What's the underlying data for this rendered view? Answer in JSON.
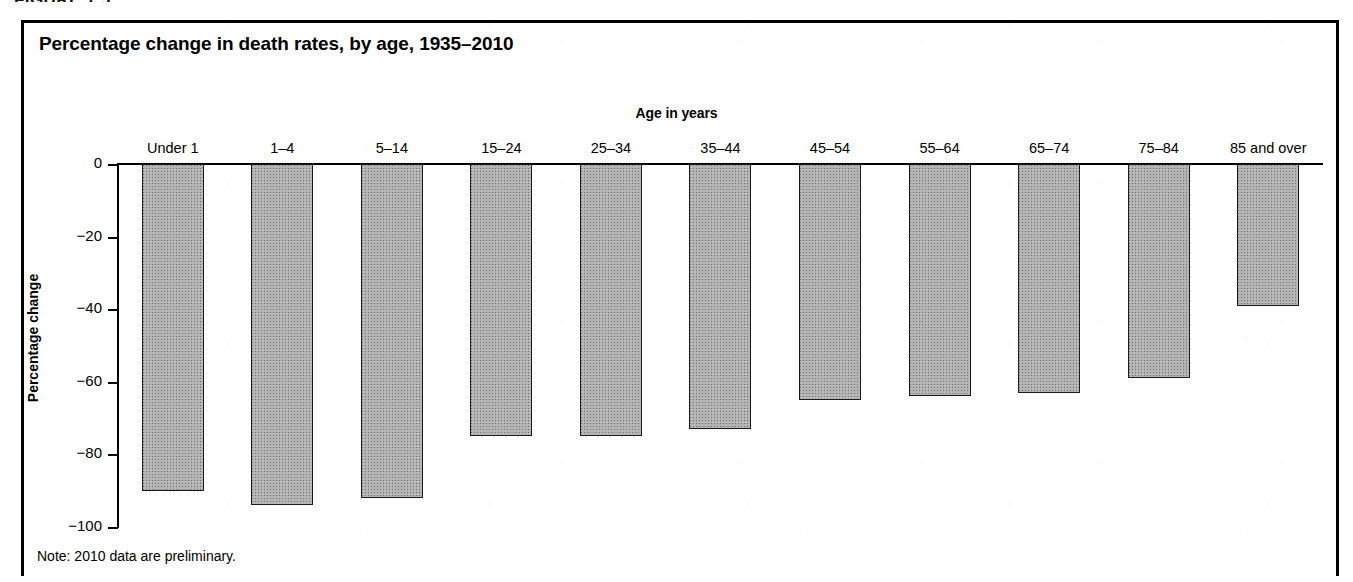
{
  "figure": {
    "number_label": "FIGURE 1.5",
    "title": "Percentage change in death rates, by age, 1935–2010",
    "note": "Note: 2010 data are preliminary."
  },
  "chart_data": {
    "type": "bar",
    "title": "Percentage change in death rates, by age, 1935–2010",
    "xlabel": "Age in years",
    "ylabel": "Percentage change",
    "categories": [
      "Under 1",
      "1–4",
      "5–14",
      "15–24",
      "25–34",
      "35–44",
      "45–54",
      "55–64",
      "65–74",
      "75–84",
      "85 and over"
    ],
    "values": [
      -90,
      -94,
      -92,
      -75,
      -75,
      -73,
      -65,
      -64,
      -63,
      -59,
      -39
    ],
    "ylim": [
      -100,
      0
    ],
    "yticks": [
      0,
      -20,
      -40,
      -60,
      -80,
      -100
    ],
    "ytick_labels": [
      "0",
      "−20",
      "−40",
      "−60",
      "−80",
      "−100"
    ],
    "grid": false,
    "legend": false,
    "bar_fill_color": "#b5b5b5",
    "bar_edge_color": "#1a1a1a",
    "annotations": [
      "Note: 2010 data are preliminary."
    ]
  }
}
